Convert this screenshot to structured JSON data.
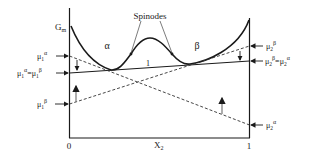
{
  "diagram": {
    "type": "free-energy-composition",
    "colors": {
      "line": "#1a1a1a",
      "dashed": "#333333",
      "arrow": "#777777",
      "text": "#222222",
      "background": "#ffffff"
    },
    "axes": {
      "y_label": "G",
      "y_label_sub": "m",
      "x_label": "X",
      "x_label_sub": "2",
      "x_min_label": "0",
      "x_max_label": "1"
    },
    "curve_labels": {
      "spinodes": "Spinodes",
      "phase_alpha": "α",
      "phase_beta": "β",
      "tangent_label": "1"
    },
    "left_labels": {
      "mu1_alpha": {
        "base": "μ",
        "sub": "1",
        "sup": "α"
      },
      "mu1_equal": {
        "base1": "μ",
        "sub1": "1",
        "sup1": "α",
        "eq": "=",
        "base2": "μ",
        "sub2": "1",
        "sup2": "β"
      },
      "mu1_beta": {
        "base": "μ",
        "sub": "1",
        "sup": "β"
      }
    },
    "right_labels": {
      "mu2_beta": {
        "base": "μ",
        "sub": "2",
        "sup": "β"
      },
      "mu2_equal": {
        "base1": "μ",
        "sub1": "2",
        "sup1": "β",
        "eq": "=",
        "base2": "μ",
        "sub2": "2",
        "sup2": "α"
      },
      "mu2_alpha": {
        "base": "μ",
        "sub": "2",
        "sup": "α"
      }
    }
  }
}
